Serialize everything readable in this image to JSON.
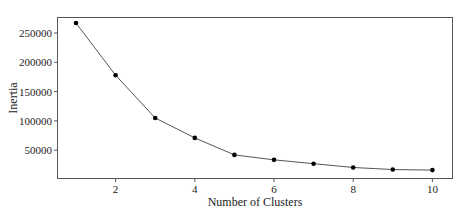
{
  "chart_data": {
    "type": "line",
    "title": "",
    "xlabel": "Number of Clusters",
    "ylabel": "Inertia",
    "x": [
      1,
      2,
      3,
      4,
      5,
      6,
      7,
      8,
      9,
      10
    ],
    "series": [
      {
        "name": "Inertia",
        "values": [
          267000,
          178000,
          105000,
          71000,
          42000,
          33500,
          27000,
          20500,
          17000,
          16000
        ],
        "marker": "circle",
        "line_color": "#555555",
        "marker_color": "#000000"
      }
    ],
    "xticks": [
      2,
      4,
      6,
      8,
      10
    ],
    "yticks": [
      50000,
      100000,
      150000,
      200000,
      250000
    ],
    "xtick_labels": [
      "2",
      "4",
      "6",
      "8",
      "10"
    ],
    "ytick_labels": [
      "50000",
      "100000",
      "150000",
      "200000",
      "250000"
    ],
    "xlim": [
      0.55,
      10.5
    ],
    "ylim": [
      5000,
      283000
    ],
    "grid": false,
    "legend": null
  }
}
